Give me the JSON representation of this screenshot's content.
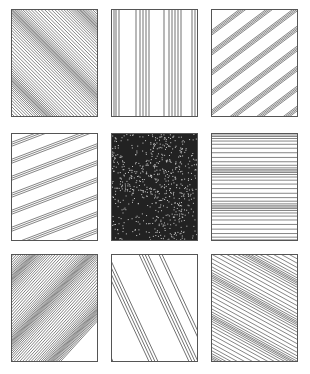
{
  "figure": {
    "layout": {
      "rows": 3,
      "cols": 3
    },
    "panels": [
      {
        "id": "p1",
        "pattern": "diagonal-down",
        "description": "Dense diagonal lines sloping down-right with dark moiré bands"
      },
      {
        "id": "p2",
        "pattern": "vertical",
        "description": "Sparse vertical line clusters"
      },
      {
        "id": "p3",
        "pattern": "diagonal-up",
        "description": "Grouped diagonal lines sloping up-right"
      },
      {
        "id": "p4",
        "pattern": "shallow-up",
        "description": "Sparse triplets of shallow lines sloping up-right"
      },
      {
        "id": "p5",
        "pattern": "noise",
        "description": "Dense random crosshatch noise texture"
      },
      {
        "id": "p6",
        "pattern": "horizontal",
        "description": "Horizontal lines with dark moiré bands"
      },
      {
        "id": "p7",
        "pattern": "diagonal-up-dense",
        "description": "Dense diagonal lines sloping up-right with moiré bands"
      },
      {
        "id": "p8",
        "pattern": "steep-down",
        "description": "Sparse groups of steep lines sloping down-right"
      },
      {
        "id": "p9",
        "pattern": "shallow-down",
        "description": "Diagonal lines sloping down-right with shaded bands"
      }
    ]
  }
}
